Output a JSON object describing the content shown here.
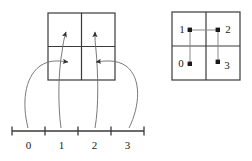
{
  "figure": {
    "stroke_color": "#3a3a3a",
    "text_color": "#1a1a1a",
    "background": "#ffffff"
  },
  "left_panel": {
    "name": "quadrant-square-with-arrows",
    "square": {
      "x": 48,
      "y": 13,
      "size": 67
    },
    "grid": {
      "mid_x": 81.5,
      "mid_y": 46.5
    },
    "arrows": [
      {
        "id": "arrow-into-bottom-left",
        "direction": "right",
        "target_quadrant": "bottom-left",
        "tip_x": 71,
        "tip_y": 62
      },
      {
        "id": "arrow-into-bottom-right",
        "direction": "left",
        "target_quadrant": "bottom-right",
        "tip_x": 93,
        "tip_y": 62
      },
      {
        "id": "arrow-into-top-left",
        "direction": "up",
        "target_quadrant": "top-left",
        "tip_x": 67,
        "tip_y": 30
      },
      {
        "id": "arrow-into-top-right",
        "direction": "up",
        "target_quadrant": "top-right",
        "tip_x": 96,
        "tip_y": 30
      }
    ]
  },
  "right_panel": {
    "name": "quadrant-square-with-indices",
    "square": {
      "x": 172,
      "y": 12,
      "size": 68
    },
    "grid": {
      "mid_x": 206,
      "mid_y": 46
    },
    "points": [
      {
        "label": "1",
        "quadrant": "top-left",
        "dot_x": 190,
        "dot_y": 30,
        "label_x": 179,
        "label_y": 25
      },
      {
        "label": "2",
        "quadrant": "top-right",
        "dot_x": 218,
        "dot_y": 30,
        "label_x": 224,
        "label_y": 25
      },
      {
        "label": "0",
        "quadrant": "bottom-left",
        "dot_x": 190,
        "dot_y": 64,
        "label_x": 178,
        "label_y": 59
      },
      {
        "label": "3",
        "quadrant": "bottom-right",
        "dot_x": 218,
        "dot_y": 62,
        "label_x": 224,
        "label_y": 61
      }
    ],
    "path_order": [
      "0",
      "1",
      "2",
      "3"
    ]
  },
  "number_line": {
    "name": "interval-axis",
    "y": 131,
    "x_start": 12,
    "x_end": 144,
    "tick_positions": [
      12,
      45,
      78,
      111,
      144
    ],
    "tick_height": 9,
    "interval_labels": [
      {
        "text": "0",
        "center_x": 28.5
      },
      {
        "text": "1",
        "center_x": 61.5
      },
      {
        "text": "2",
        "center_x": 94.5
      },
      {
        "text": "3",
        "center_x": 127.5
      }
    ],
    "label_y": 140
  }
}
